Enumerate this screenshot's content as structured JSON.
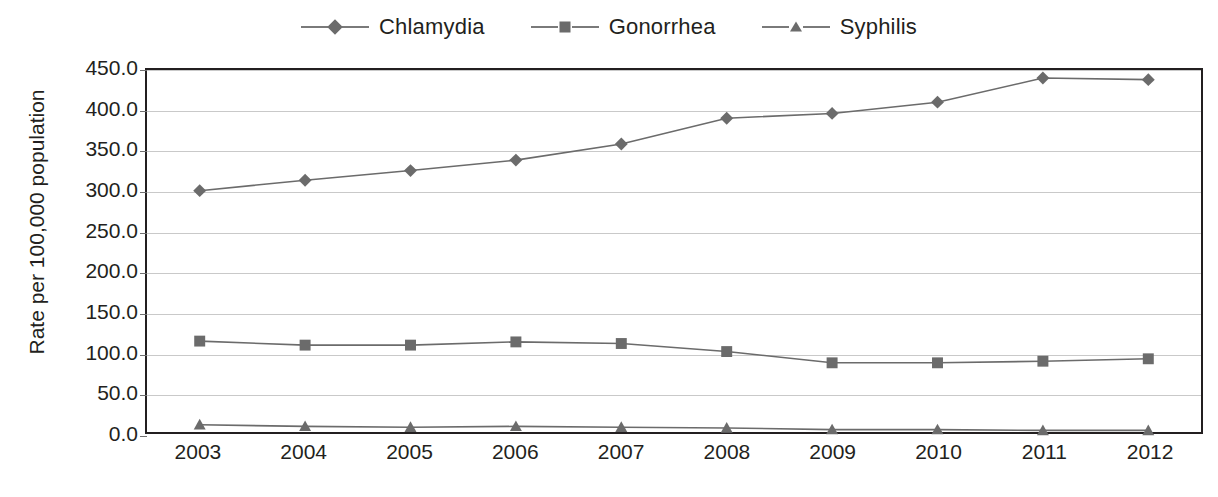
{
  "chart_data": {
    "type": "line",
    "title": "",
    "xlabel": "",
    "ylabel": "Rate per 100,000 population",
    "categories": [
      "2003",
      "2004",
      "2005",
      "2006",
      "2007",
      "2008",
      "2009",
      "2010",
      "2011",
      "2012"
    ],
    "ylim": [
      0,
      450
    ],
    "ytick_step": 50,
    "ytick_labels": [
      "450.0",
      "400.0",
      "350.0",
      "300.0",
      "250.0",
      "200.0",
      "150.0",
      "100.0",
      "50.0",
      "0.0"
    ],
    "grid": true,
    "legend_position": "top-center",
    "series": [
      {
        "name": "Chlamydia",
        "marker": "diamond",
        "color": "#6b6b6b",
        "values": [
          300,
          313,
          325,
          338,
          358,
          390,
          396,
          410,
          440,
          438
        ]
      },
      {
        "name": "Gonorrhea",
        "marker": "square",
        "color": "#6b6b6b",
        "values": [
          113,
          108,
          108,
          112,
          110,
          100,
          86,
          86,
          88,
          91
        ]
      },
      {
        "name": "Syphilis",
        "marker": "triangle",
        "color": "#6b6b6b",
        "values": [
          9,
          7,
          6,
          7,
          6,
          5,
          3,
          3,
          2,
          2
        ]
      }
    ]
  },
  "legend": {
    "items": [
      {
        "label": "Chlamydia",
        "marker": "diamond-marker-icon"
      },
      {
        "label": "Gonorrhea",
        "marker": "square-marker-icon"
      },
      {
        "label": "Syphilis",
        "marker": "triangle-marker-icon"
      }
    ]
  },
  "colors": {
    "series": "#6b6b6b",
    "gridline": "#c9c9c9",
    "axis": "#231f20",
    "text": "#231f20",
    "background": "#ffffff"
  },
  "caption": {
    "text": ""
  }
}
